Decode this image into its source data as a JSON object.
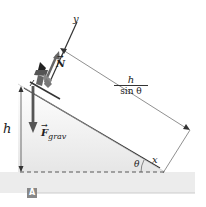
{
  "diagram": {
    "labels": {
      "y_axis": "y",
      "x_axis": "x",
      "normal_force": "N",
      "gravity_force": "F",
      "gravity_subscript": "grav",
      "height": "h",
      "angle": "θ",
      "hyp_numerator": "h",
      "hyp_denominator": "sin θ",
      "panel": "A"
    },
    "colors": {
      "slope_fill": "#e8e8e8",
      "line": "#333333",
      "arrow": "#555555",
      "badge": "#888888"
    }
  }
}
